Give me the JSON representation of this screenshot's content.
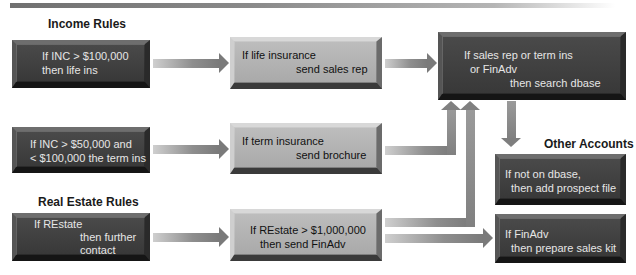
{
  "diagram": {
    "sections": {
      "income_rules": "Income Rules",
      "real_estate_rules": "Real Estate Rules",
      "other_accounts": "Other Accounts"
    },
    "left_boxes": [
      {
        "lines": [
          "If INC > $100,000",
          "then life ins"
        ]
      },
      {
        "lines": [
          "If INC > $50,000 and",
          "< $100,000 the term ins"
        ]
      },
      {
        "lines": [
          "If REstate",
          "then further",
          "contact"
        ]
      }
    ],
    "middle_boxes": [
      {
        "lines": [
          "If life insurance",
          "send sales rep"
        ]
      },
      {
        "lines": [
          "If term insurance",
          "send brochure"
        ]
      },
      {
        "lines": [
          "If REstate > $1,000,000",
          "then send FinAdv"
        ]
      }
    ],
    "top_right_box": {
      "lines": [
        "If sales rep or term ins",
        "or FinAdv",
        "then search dbase"
      ]
    },
    "right_boxes": [
      {
        "lines": [
          "If not on dbase,",
          "then add prospect file"
        ]
      },
      {
        "lines": [
          "If FinAdv",
          "then prepare sales kit"
        ]
      }
    ],
    "colors": {
      "dark_box": "#3e3e3e",
      "light_box": "#b3b3b3",
      "arrow": "#7a7a7a",
      "banner": "#808080"
    }
  }
}
